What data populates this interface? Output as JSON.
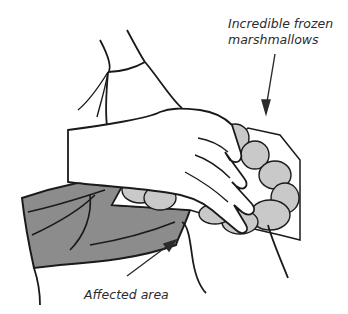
{
  "annotations": {
    "marshmallows_line1": "Incredible frozen",
    "marshmallows_line2": "marshmallows",
    "affected_area": "Affected area"
  },
  "colors": {
    "pants": "#8c8c8c",
    "marshmallow": "#c9c9c9",
    "ink": "#1a1a1a",
    "text": "#2b2b2b"
  }
}
